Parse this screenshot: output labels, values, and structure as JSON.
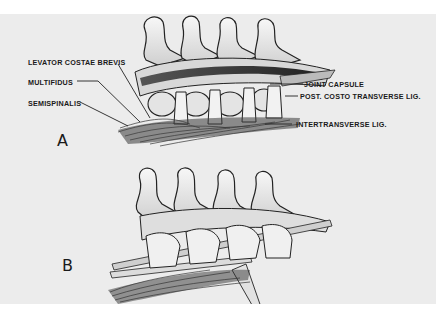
{
  "figure": {
    "panels": [
      {
        "id": "A",
        "letter": "A"
      },
      {
        "id": "B",
        "letter": "B"
      }
    ],
    "labels_left": [
      {
        "text": "LEVATOR COSTAE BREVIS"
      },
      {
        "text": "MULTIFIDUS"
      },
      {
        "text": "SEMISPINALIS"
      }
    ],
    "labels_right": [
      {
        "text": "JOINT CAPSULE"
      },
      {
        "text": "POST. COSTO TRANSVERSE LIG."
      },
      {
        "text": "INTERTRANSVERSE LIG."
      }
    ],
    "colors": {
      "background": "#ececec",
      "page": "#ffffff",
      "ink": "#1a1a1a",
      "bone": "#f4f4f4"
    }
  }
}
